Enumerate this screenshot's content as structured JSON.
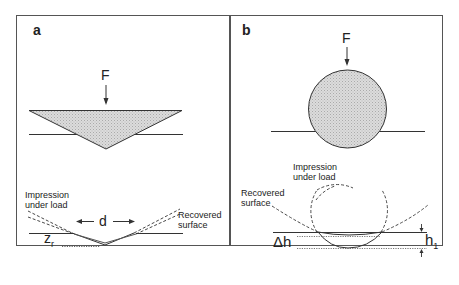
{
  "panels": {
    "a": {
      "label": "a",
      "force_label": "F",
      "impression_label_line1": "Impression",
      "impression_label_line2": "under load",
      "recovered_label_line1": "Recovered",
      "recovered_label_line2": "surface",
      "diameter_label": "d",
      "depth_label_main": "z",
      "depth_label_sub": "r"
    },
    "b": {
      "label": "b",
      "force_label": "F",
      "impression_label_line1": "Impression",
      "impression_label_line2": "under load",
      "recovered_label_line1": "Recovered",
      "recovered_label_line2": "surface",
      "delta_label": "Δh",
      "height_label_main": "h",
      "height_label_sub": "1"
    }
  },
  "colors": {
    "line": "#333333",
    "fill": "#d4d4d4",
    "border": "#555555"
  }
}
